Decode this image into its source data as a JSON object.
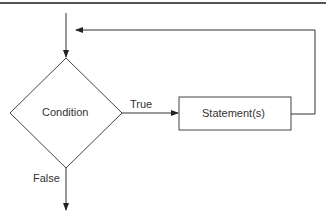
{
  "diagram": {
    "type": "flowchart",
    "nodes": {
      "condition": {
        "label": "Condition",
        "shape": "diamond"
      },
      "statements": {
        "label": "Statement(s)",
        "shape": "rectangle"
      }
    },
    "edges": {
      "true_label": "True",
      "false_label": "False"
    },
    "colors": {
      "line": "#333333",
      "text": "#333333",
      "rule": "#555555",
      "background": "#ffffff"
    }
  }
}
